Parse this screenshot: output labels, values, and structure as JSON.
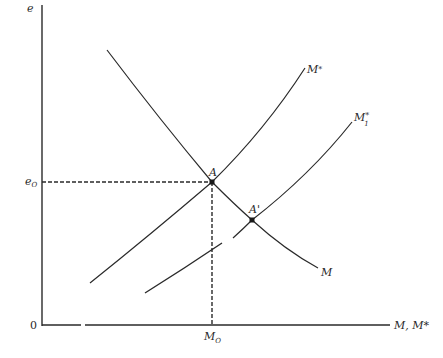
{
  "diagram": {
    "type": "economic supply-demand style diagram",
    "axes": {
      "y_label": "e",
      "x_label": "M, M*",
      "origin_label": "0"
    },
    "curves": [
      {
        "name": "M",
        "label": "M",
        "shape": "downward sloping"
      },
      {
        "name": "M*",
        "label_main": "M",
        "label_sup": "*",
        "shape": "upward sloping"
      },
      {
        "name": "M1*",
        "label_main": "M",
        "label_sup": "*",
        "label_sub": "1",
        "shape": "upward sloping, shifted right"
      }
    ],
    "points": [
      {
        "label": "A",
        "description": "intersection of M and M*"
      },
      {
        "label": "A'",
        "description": "intersection of M and M1*"
      }
    ],
    "reference_lines": {
      "horizontal_label_main": "e",
      "horizontal_label_sub": "O",
      "vertical_label_main": "M",
      "vertical_label_sub": "O"
    },
    "colors": {
      "line": "#2a2a2a",
      "background": "#ffffff"
    }
  }
}
